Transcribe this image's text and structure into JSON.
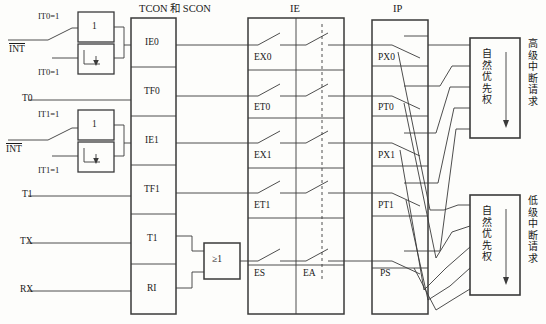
{
  "diagram": {
    "title_tcon": "TCON 和 SCON",
    "title_ie": "IE",
    "title_ip": "IP",
    "inputs": [
      {
        "id": "int0",
        "label": "INT",
        "overline": true,
        "y": 48
      },
      {
        "id": "t0",
        "label": "T0",
        "overline": false,
        "y": 100
      },
      {
        "id": "int1",
        "label": "INT",
        "overline": true,
        "y": 148
      },
      {
        "id": "t1",
        "label": "T1",
        "overline": false,
        "y": 196
      },
      {
        "id": "tx",
        "label": "TX",
        "overline": false,
        "y": 243
      },
      {
        "id": "rx",
        "label": "RX",
        "overline": false,
        "y": 291
      }
    ],
    "mode_labels": [
      {
        "id": "it0-edge",
        "text": "IT0=1",
        "x": 40,
        "y": 16
      },
      {
        "id": "it0-level",
        "text": "IT0=1",
        "x": 40,
        "y": 70
      },
      {
        "id": "it1-edge",
        "text": "IT1=1",
        "x": 40,
        "y": 113
      },
      {
        "id": "it1-level",
        "text": "IT1=1",
        "x": 40,
        "y": 167
      }
    ],
    "mode_boxes": [
      {
        "id": "int0-edge-box",
        "glyph": "1"
      },
      {
        "id": "int0-level-box",
        "glyph": "edge-arrow"
      },
      {
        "id": "int1-edge-box",
        "glyph": "1"
      },
      {
        "id": "int1-level-box",
        "glyph": "edge-arrow"
      }
    ],
    "tcon_flags": [
      "IE0",
      "TF0",
      "IE1",
      "TF1",
      "T1",
      "RI"
    ],
    "or_gate": {
      "label": "≥1"
    },
    "ie_enable_bits": [
      "EX0",
      "ET0",
      "EX1",
      "ET1",
      "ES"
    ],
    "ie_global_bit": "EA",
    "ip_priority_bits": [
      "PX0",
      "PT0",
      "PX1",
      "PT1",
      "PS"
    ],
    "priority_boxes": [
      {
        "id": "high",
        "inner": "自然优先权",
        "outer": "高级中断请求"
      },
      {
        "id": "low",
        "inner": "自然优先权",
        "outer": "低级中断请求"
      }
    ],
    "colors": {
      "line": "#3a3a3a",
      "text": "#1a1a1a",
      "background": "#fdfdfb"
    }
  }
}
